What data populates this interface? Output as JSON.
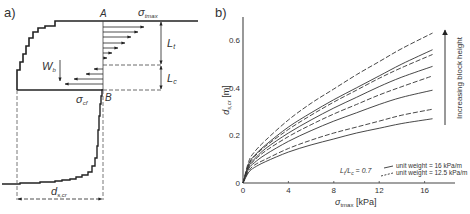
{
  "panel_a": {
    "label": "a)",
    "point_a": "A",
    "point_b": "B",
    "sigma_tmax": {
      "sym": "σ",
      "sub": "tmax"
    },
    "sigma_cf": {
      "sym": "σ",
      "sub": "cf"
    },
    "lt": {
      "sym": "L",
      "sub": "t"
    },
    "lc": {
      "sym": "L",
      "sub": "c"
    },
    "wb": {
      "sym": "W",
      "sub": "b"
    },
    "dscr": {
      "sym": "d",
      "sub": "s,cr"
    }
  },
  "panel_b": {
    "label": "b)",
    "ratio_label": "Lt/Lc = 0.7",
    "ratio": {
      "l1": "L",
      "s1": "t",
      "slash": "/",
      "l2": "L",
      "s2": "c",
      "rest": " = 0.7"
    },
    "arrow_label": "Increasing block height",
    "legend": [
      {
        "style": "solid",
        "label": "unit weight = 16 kPa/m"
      },
      {
        "style": "dashed",
        "label": "unit weight = 12.5 kPa/m"
      }
    ]
  },
  "chart_data": {
    "type": "line",
    "title": "",
    "xlabel": "σtmax [kPa]",
    "ylabel": "ds,cr [m]",
    "xlim": [
      0,
      18.5
    ],
    "ylim": [
      0,
      0.7
    ],
    "xticks": [
      0,
      4,
      8,
      12,
      16
    ],
    "yticks": [
      0,
      0.2,
      0.4,
      0.6
    ],
    "grid": false,
    "legend_position": "lower right",
    "annotations": [
      "Lt/Lc = 0.7",
      "Increasing block height"
    ],
    "x": [
      0,
      0.5,
      1,
      2,
      4,
      6,
      8,
      10,
      12,
      14,
      16.7
    ],
    "series": [
      {
        "name": "unit weight = 16 kPa/m (height 1)",
        "style": "solid",
        "values": [
          0,
          0.045,
          0.065,
          0.09,
          0.13,
          0.16,
          0.185,
          0.21,
          0.23,
          0.25,
          0.27
        ]
      },
      {
        "name": "unit weight = 12.5 kPa/m (height 1)",
        "style": "dashed",
        "values": [
          0,
          0.05,
          0.075,
          0.1,
          0.145,
          0.18,
          0.21,
          0.235,
          0.26,
          0.285,
          0.31
        ]
      },
      {
        "name": "unit weight = 16 kPa/m (height 2)",
        "style": "solid",
        "values": [
          0,
          0.06,
          0.085,
          0.12,
          0.175,
          0.22,
          0.26,
          0.295,
          0.33,
          0.36,
          0.39
        ]
      },
      {
        "name": "unit weight = 12.5 kPa/m (height 2)",
        "style": "dashed",
        "values": [
          0,
          0.065,
          0.095,
          0.135,
          0.195,
          0.245,
          0.29,
          0.33,
          0.37,
          0.405,
          0.45
        ]
      },
      {
        "name": "unit weight = 16 kPa/m (height 3)",
        "style": "solid",
        "values": [
          0,
          0.07,
          0.1,
          0.145,
          0.21,
          0.265,
          0.315,
          0.36,
          0.405,
          0.445,
          0.49
        ]
      },
      {
        "name": "unit weight = 12.5 kPa/m (height 3)",
        "style": "dashed",
        "values": [
          0,
          0.075,
          0.11,
          0.155,
          0.225,
          0.285,
          0.34,
          0.39,
          0.44,
          0.485,
          0.54
        ]
      },
      {
        "name": "unit weight = 16 kPa/m (height 4)",
        "style": "solid",
        "values": [
          0,
          0.08,
          0.115,
          0.16,
          0.235,
          0.295,
          0.35,
          0.4,
          0.45,
          0.5,
          0.56
        ]
      },
      {
        "name": "unit weight = 12.5 kPa/m (height 4)",
        "style": "dashed",
        "values": [
          0,
          0.09,
          0.13,
          0.18,
          0.265,
          0.335,
          0.395,
          0.455,
          0.51,
          0.565,
          0.63
        ]
      }
    ]
  }
}
